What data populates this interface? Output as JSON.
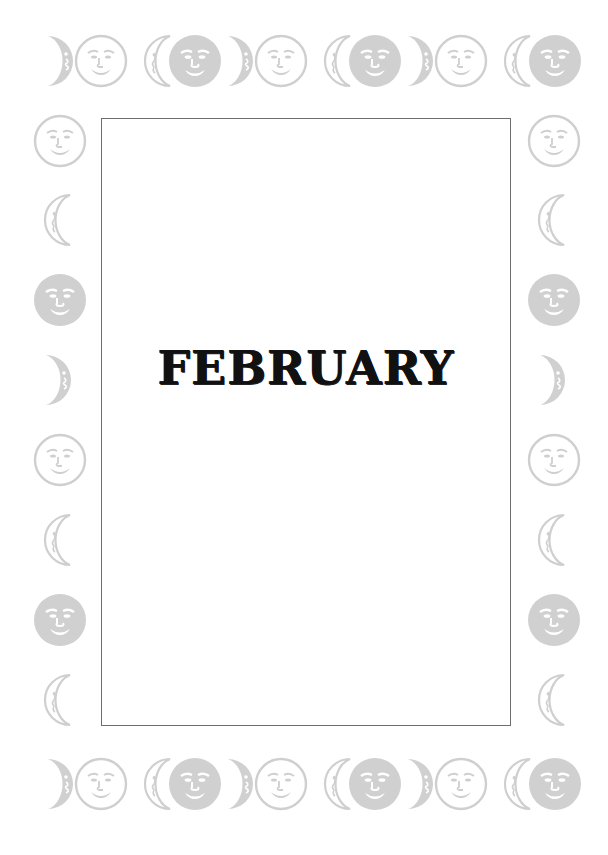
{
  "page": {
    "title": "FEBRUARY",
    "colors": {
      "background": "#ffffff",
      "icon_gray": "#cfcfcf",
      "frame_border": "#6e6e6e",
      "title_text": "#111111"
    }
  },
  "border": {
    "icon_types": [
      "crescent-filled-right",
      "face-outline",
      "crescent-outline-left",
      "face-filled"
    ],
    "top_row": [
      {
        "type": "crescent-filled-right",
        "x": 34,
        "y": 33
      },
      {
        "type": "face-outline",
        "x": 73,
        "y": 33
      },
      {
        "type": "crescent-outline-left",
        "x": 132,
        "y": 33
      },
      {
        "type": "face-filled",
        "x": 167,
        "y": 33
      },
      {
        "type": "crescent-filled-right",
        "x": 214,
        "y": 33
      },
      {
        "type": "face-outline",
        "x": 253,
        "y": 33
      },
      {
        "type": "crescent-outline-left",
        "x": 312,
        "y": 33
      },
      {
        "type": "face-filled",
        "x": 347,
        "y": 33
      },
      {
        "type": "crescent-filled-right",
        "x": 394,
        "y": 33
      },
      {
        "type": "face-outline",
        "x": 433,
        "y": 33
      },
      {
        "type": "crescent-outline-left",
        "x": 492,
        "y": 33
      },
      {
        "type": "face-filled",
        "x": 527,
        "y": 33
      }
    ],
    "bottom_row": [
      {
        "type": "crescent-filled-right",
        "x": 34,
        "y": 756
      },
      {
        "type": "face-outline",
        "x": 73,
        "y": 756
      },
      {
        "type": "crescent-outline-left",
        "x": 132,
        "y": 756
      },
      {
        "type": "face-filled",
        "x": 167,
        "y": 756
      },
      {
        "type": "crescent-filled-right",
        "x": 214,
        "y": 756
      },
      {
        "type": "face-outline",
        "x": 253,
        "y": 756
      },
      {
        "type": "crescent-outline-left",
        "x": 312,
        "y": 756
      },
      {
        "type": "face-filled",
        "x": 347,
        "y": 756
      },
      {
        "type": "crescent-filled-right",
        "x": 394,
        "y": 756
      },
      {
        "type": "face-outline",
        "x": 433,
        "y": 756
      },
      {
        "type": "crescent-outline-left",
        "x": 492,
        "y": 756
      },
      {
        "type": "face-filled",
        "x": 527,
        "y": 756
      }
    ],
    "left_column": [
      {
        "type": "face-outline",
        "x": 32,
        "y": 113
      },
      {
        "type": "crescent-outline-left",
        "x": 32,
        "y": 192
      },
      {
        "type": "face-filled",
        "x": 32,
        "y": 272
      },
      {
        "type": "crescent-filled-right",
        "x": 32,
        "y": 352
      },
      {
        "type": "face-outline",
        "x": 32,
        "y": 432
      },
      {
        "type": "crescent-outline-left",
        "x": 32,
        "y": 512
      },
      {
        "type": "face-filled",
        "x": 32,
        "y": 592
      },
      {
        "type": "crescent-outline-left",
        "x": 32,
        "y": 672
      }
    ],
    "right_column": [
      {
        "type": "face-outline",
        "x": 526,
        "y": 113
      },
      {
        "type": "crescent-outline-left",
        "x": 526,
        "y": 192
      },
      {
        "type": "face-filled",
        "x": 526,
        "y": 272
      },
      {
        "type": "crescent-filled-right",
        "x": 526,
        "y": 352
      },
      {
        "type": "face-outline",
        "x": 526,
        "y": 432
      },
      {
        "type": "crescent-outline-left",
        "x": 526,
        "y": 512
      },
      {
        "type": "face-filled",
        "x": 526,
        "y": 592
      },
      {
        "type": "crescent-outline-left",
        "x": 526,
        "y": 672
      }
    ]
  }
}
